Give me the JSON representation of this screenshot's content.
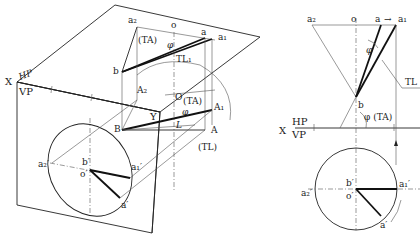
{
  "figure": {
    "left_pictorial": {
      "plane_labels": {
        "x": "X",
        "hp": "HP",
        "vp": "VP",
        "y": "Y"
      },
      "top_points": {
        "a2": "a₂",
        "o": "o",
        "a": "a",
        "a1": "a₁",
        "b": "b"
      },
      "top_annotations": {
        "ta": "(TA)",
        "phi": "φ",
        "tl": "TL₁"
      },
      "space_points": {
        "A2": "A₂",
        "O": "O",
        "A1": "A₁",
        "A": "A",
        "B": "B",
        "L": "L"
      },
      "space_annotations": {
        "ta": "(TA)",
        "phi": "φ",
        "tl": "(TL)"
      },
      "front_points": {
        "a2p": "a₂′",
        "bp": "b′",
        "op": "o′",
        "a1p": "a₁′",
        "ap": "a′"
      }
    },
    "right_orthographic": {
      "plane_labels": {
        "x": "X",
        "hp": "HP",
        "vp": "VP"
      },
      "top_points": {
        "a2": "a₂",
        "o": "o",
        "a": "a",
        "arrow": "→",
        "a1": "a₁",
        "b": "b"
      },
      "top_annotations": {
        "phi": "φ",
        "tl": "TL",
        "phi_ta": "φ (TA)"
      },
      "front_points": {
        "bp": "b′",
        "op": "o′",
        "a1p": "a₁′",
        "a2p": "a₂′",
        "ap": "a′"
      }
    }
  }
}
